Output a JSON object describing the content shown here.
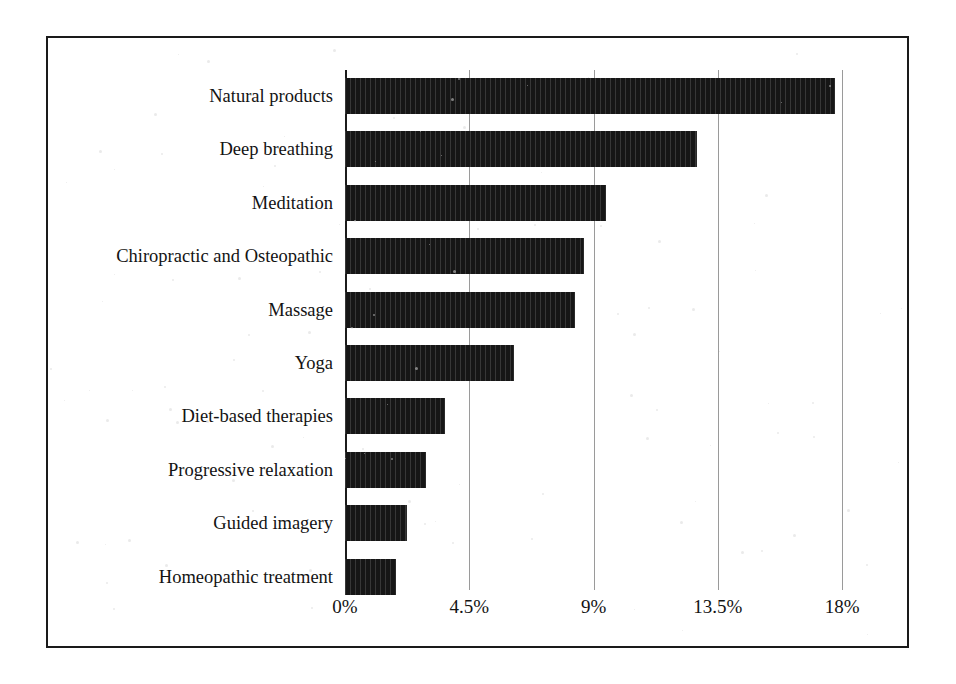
{
  "figure": {
    "background_color": "#ffffff",
    "border_color": "#1a1a1a",
    "bar_color": "#161616",
    "gridline_color": "#9a9a9a"
  },
  "chart_data": {
    "type": "bar",
    "orientation": "horizontal",
    "title": "",
    "subtitle": "",
    "xlabel": "",
    "ylabel": "",
    "categories": [
      "Natural products",
      "Deep breathing",
      "Meditation",
      "Chiropractic and Osteopathic",
      "Massage",
      "Yoga",
      "Diet-based therapies",
      "Progressive relaxation",
      "Guided imagery",
      "Homeopathic treatment"
    ],
    "values": [
      17.7,
      12.7,
      9.4,
      8.6,
      8.3,
      6.1,
      3.6,
      2.9,
      2.2,
      1.8
    ],
    "value_unit": "%",
    "xlim": [
      0,
      19.5
    ],
    "xticks": [
      0,
      4.5,
      9,
      13.5,
      18
    ],
    "xticklabels": [
      "0%",
      "4.5%",
      "9%",
      "13.5%",
      "18%"
    ],
    "grid": true,
    "grid_axis": "x",
    "legend": false,
    "legend_position": "none",
    "series": [
      {
        "name": "Percent of adults",
        "values": [
          17.7,
          12.7,
          9.4,
          8.6,
          8.3,
          6.1,
          3.6,
          2.9,
          2.2,
          1.8
        ]
      }
    ]
  }
}
